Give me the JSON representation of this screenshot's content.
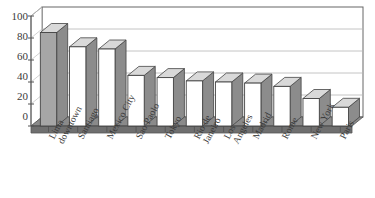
{
  "chart_data": {
    "type": "bar",
    "title": "",
    "subtitle": "",
    "xlabel": "",
    "ylabel": "",
    "ylim": [
      0,
      100
    ],
    "yticks": [
      0,
      20,
      40,
      60,
      80,
      100
    ],
    "grid": true,
    "legend": "none",
    "style": "3d-column",
    "categories": [
      "Lima downtown",
      "Santiago",
      "Mexico City",
      "Sao Paolo",
      "Tokyo",
      "Rio de Janeiro",
      "Los Angeles",
      "Madrid",
      "Rome",
      "New York",
      "Paris"
    ],
    "category_lines": [
      [
        "Lima",
        "downtown"
      ],
      [
        "Santiago"
      ],
      [
        "Mexico City"
      ],
      [
        "Sao Paolo"
      ],
      [
        "Tokyo"
      ],
      [
        "Rio de",
        "Janeiro"
      ],
      [
        "Los",
        "Angeles"
      ],
      [
        "Madrid"
      ],
      [
        "Rome"
      ],
      [
        "New York"
      ],
      [
        "Paris"
      ]
    ],
    "values": [
      85,
      72,
      70,
      46,
      44,
      41,
      40,
      39,
      36,
      25,
      17
    ],
    "highlight_index": 0,
    "colors": {
      "bar_fill": "#ffffff",
      "bar_highlight_fill": "#a6a6a6",
      "bar_side": "#8c8c8c",
      "bar_top": "#d9d9d9",
      "bar_outline": "#444444",
      "floor": "#808080",
      "floor_top": "#6e6e6e",
      "gridline": "#b5b5b5",
      "axis": "#555555",
      "text": "#3a3a3a",
      "background": "#ffffff"
    }
  }
}
